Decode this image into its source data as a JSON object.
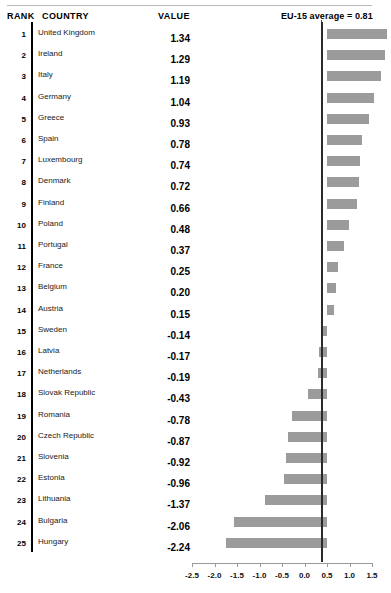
{
  "header": {
    "rank_label": "RANK",
    "country_label": "COUNTRY",
    "value_label": "VALUE",
    "reference_label": "EU-15 average = 0.81"
  },
  "chart_data": {
    "type": "bar",
    "title": "",
    "xlabel": "",
    "ylabel": "",
    "orientation": "horizontal",
    "grid": false,
    "legend": null,
    "xlim": [
      -2.5,
      1.5
    ],
    "xticks": [
      -2.5,
      -2.0,
      -1.5,
      -1.0,
      -0.5,
      0.0,
      0.5,
      1.0,
      1.5
    ],
    "xticklabels": [
      "-2.5",
      "-2.0",
      "-1.5",
      "-1.0",
      "-0.5",
      "0.0",
      "0.5",
      "1.0",
      "1.5"
    ],
    "baseline": 0.5,
    "reference_line": {
      "value": 0.5,
      "label": "EU-15 average = 0.81"
    },
    "bar_color": "#9b9b9b",
    "categories": [
      "United Kingdom",
      "Ireland",
      "Italy",
      "Germany",
      "Greece",
      "Spain",
      "Luxembourg",
      "Denmark",
      "Finland",
      "Poland",
      "Portugal",
      "France",
      "Belgium",
      "Austria",
      "Sweden",
      "Latvia",
      "Netherlands",
      "Slovak Republic",
      "Romania",
      "Czech Republic",
      "Slovenia",
      "Estonia",
      "Lithuania",
      "Bulgaria",
      "Hungary"
    ],
    "values": [
      1.34,
      1.29,
      1.19,
      1.04,
      0.93,
      0.78,
      0.74,
      0.72,
      0.66,
      0.48,
      0.37,
      0.25,
      0.2,
      0.15,
      -0.14,
      -0.17,
      -0.19,
      -0.43,
      -0.78,
      -0.87,
      -0.92,
      -0.96,
      -1.37,
      -2.06,
      -2.24
    ]
  },
  "rows": [
    {
      "rank": "1",
      "country": "United Kingdom",
      "value": "1.34",
      "num": 1.34
    },
    {
      "rank": "2",
      "country": "Ireland",
      "value": "1.29",
      "num": 1.29
    },
    {
      "rank": "3",
      "country": "Italy",
      "value": "1.19",
      "num": 1.19
    },
    {
      "rank": "4",
      "country": "Germany",
      "value": "1.04",
      "num": 1.04
    },
    {
      "rank": "5",
      "country": "Greece",
      "value": "0.93",
      "num": 0.93
    },
    {
      "rank": "6",
      "country": "Spain",
      "value": "0.78",
      "num": 0.78
    },
    {
      "rank": "7",
      "country": "Luxembourg",
      "value": "0.74",
      "num": 0.74
    },
    {
      "rank": "8",
      "country": "Denmark",
      "value": "0.72",
      "num": 0.72
    },
    {
      "rank": "9",
      "country": "Finland",
      "value": "0.66",
      "num": 0.66
    },
    {
      "rank": "10",
      "country": "Poland",
      "value": "0.48",
      "num": 0.48
    },
    {
      "rank": "11",
      "country": "Portugal",
      "value": "0.37",
      "num": 0.37
    },
    {
      "rank": "12",
      "country": "France",
      "value": "0.25",
      "num": 0.25
    },
    {
      "rank": "13",
      "country": "Belgium",
      "value": "0.20",
      "num": 0.2
    },
    {
      "rank": "14",
      "country": "Austria",
      "value": "0.15",
      "num": 0.15
    },
    {
      "rank": "15",
      "country": "Sweden",
      "value": "-0.14",
      "num": -0.14
    },
    {
      "rank": "16",
      "country": "Latvia",
      "value": "-0.17",
      "num": -0.17
    },
    {
      "rank": "17",
      "country": "Netherlands",
      "value": "-0.19",
      "num": -0.19
    },
    {
      "rank": "18",
      "country": "Slovak Republic",
      "value": "-0.43",
      "num": -0.43
    },
    {
      "rank": "19",
      "country": "Romania",
      "value": "-0.78",
      "num": -0.78
    },
    {
      "rank": "20",
      "country": "Czech Republic",
      "value": "-0.87",
      "num": -0.87
    },
    {
      "rank": "21",
      "country": "Slovenia",
      "value": "-0.92",
      "num": -0.92
    },
    {
      "rank": "22",
      "country": "Estonia",
      "value": "-0.96",
      "num": -0.96
    },
    {
      "rank": "23",
      "country": "Lithuania",
      "value": "-1.37",
      "num": -1.37
    },
    {
      "rank": "24",
      "country": "Bulgaria",
      "value": "-2.06",
      "num": -2.06
    },
    {
      "rank": "25",
      "country": "Hungary",
      "value": "-2.24",
      "num": -2.24
    }
  ]
}
